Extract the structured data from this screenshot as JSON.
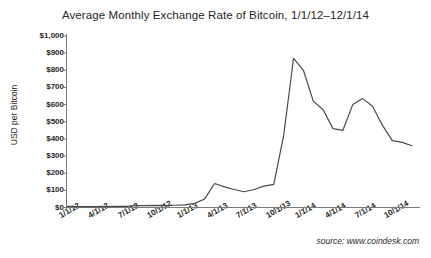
{
  "chart_data": {
    "type": "line",
    "title": "Average Monthly Exchange Rate of Bitcoin, 1/1/12–12/1/14",
    "xlabel": "",
    "ylabel": "USD per Bitcoin",
    "ylim": [
      0,
      1000
    ],
    "y_ticks": [
      0,
      100,
      200,
      300,
      400,
      500,
      600,
      700,
      800,
      900,
      1000
    ],
    "y_tick_labels": [
      "$0",
      "$100",
      "$200",
      "$300",
      "$400",
      "$500",
      "$600",
      "$700",
      "$800",
      "$900",
      "$1,000"
    ],
    "x_tick_labels": [
      "1/1/12",
      "4/1/12",
      "7/1/12",
      "10/1/12",
      "1/1/13",
      "4/1/13",
      "7/1/13",
      "10/1/13",
      "1/1/14",
      "4/1/14",
      "7/1/14",
      "10/1/14"
    ],
    "x_tick_indices": [
      0,
      3,
      6,
      9,
      12,
      15,
      18,
      21,
      24,
      27,
      30,
      33
    ],
    "grid": false,
    "legend": "none",
    "line_color": "#4a4a4a",
    "x": [
      "1/1/12",
      "2/1/12",
      "3/1/12",
      "4/1/12",
      "5/1/12",
      "6/1/12",
      "7/1/12",
      "8/1/12",
      "9/1/12",
      "10/1/12",
      "11/1/12",
      "12/1/12",
      "1/1/13",
      "2/1/13",
      "3/1/13",
      "4/1/13",
      "5/1/13",
      "6/1/13",
      "7/1/13",
      "8/1/13",
      "9/1/13",
      "10/1/13",
      "11/1/13",
      "12/1/13",
      "1/1/14",
      "2/1/14",
      "3/1/14",
      "4/1/14",
      "5/1/14",
      "6/1/14",
      "7/1/14",
      "8/1/14",
      "9/1/14",
      "10/1/14",
      "11/1/14",
      "12/1/14"
    ],
    "values": [
      6,
      5,
      5,
      5,
      5,
      6,
      7,
      11,
      11,
      12,
      11,
      13,
      15,
      24,
      50,
      140,
      120,
      105,
      92,
      105,
      125,
      135,
      420,
      870,
      800,
      620,
      570,
      460,
      450,
      600,
      635,
      590,
      480,
      390,
      380,
      360
    ],
    "source": "source: www.coindesk.com"
  },
  "source_note": "source: www.coindesk.com"
}
